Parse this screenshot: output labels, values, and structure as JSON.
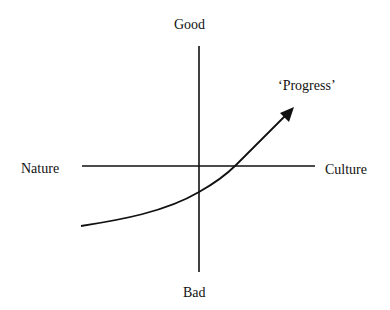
{
  "diagram": {
    "axes": {
      "vertical": {
        "top_label": "Good",
        "bottom_label": "Bad"
      },
      "horizontal": {
        "left_label": "Nature",
        "right_label": "Culture"
      }
    },
    "curve": {
      "label": "‘Progress’",
      "shape": "rising curve with arrowhead",
      "arrow_icon": "arrowhead-icon"
    },
    "colors": {
      "line": "#111111",
      "background": "#ffffff"
    }
  }
}
